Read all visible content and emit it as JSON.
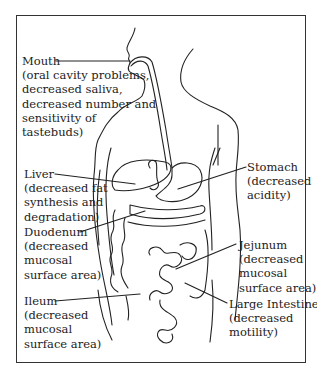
{
  "diagram": {
    "labels": [
      {
        "id": "mouth",
        "name": "Mouth",
        "lines": [
          "(oral cavity problems,",
          "decreased saliva,",
          "decreased number and",
          "sensitivity of",
          "tastebuds)"
        ]
      },
      {
        "id": "liver",
        "name": "Liver",
        "lines": [
          "(decreased fat",
          "synthesis and",
          "degradation)"
        ]
      },
      {
        "id": "duodenum",
        "name": "Duodenum",
        "lines": [
          "(decreased",
          "mucosal",
          "surface area)"
        ]
      },
      {
        "id": "ileum",
        "name": "Ileum",
        "lines": [
          "(decreased",
          "mucosal",
          "surface area)"
        ]
      },
      {
        "id": "stomach",
        "name": "Stomach",
        "lines": [
          "(decreased",
          "acidity)"
        ]
      },
      {
        "id": "jejunum",
        "name": "Jejunum",
        "lines": [
          "(decreased",
          "mucosal",
          "surface area)"
        ]
      },
      {
        "id": "large-intestine",
        "name": "Large Intestine",
        "lines": [
          "(decreased",
          "motility)"
        ]
      }
    ]
  }
}
